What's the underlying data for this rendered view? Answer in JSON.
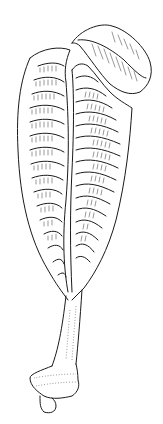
{
  "illustration": {
    "subject": "sea-pen-line-drawing",
    "background": "#ffffff",
    "ink_color": "#1a1a1a",
    "left_leaf_ridges": 16,
    "right_leaf_ridges": 16
  }
}
